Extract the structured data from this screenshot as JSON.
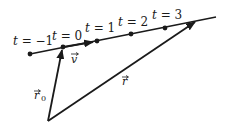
{
  "diagram": {
    "title": "",
    "line_labels": [
      {
        "id": "t-minus-1",
        "text": "t = −1",
        "x": 13,
        "y": 45
      },
      {
        "id": "t-0",
        "text": "t = 0",
        "x": 52,
        "y": 40
      },
      {
        "id": "t-1",
        "text": "t = 1",
        "x": 85,
        "y": 32
      },
      {
        "id": "t-2",
        "text": "t = 2",
        "x": 118,
        "y": 26
      },
      {
        "id": "t-3",
        "text": "t = 3",
        "x": 152,
        "y": 19
      }
    ],
    "points": [
      {
        "t": -1,
        "x": 30,
        "y": 54
      },
      {
        "t": 0,
        "x": 63,
        "y": 47
      },
      {
        "t": 1,
        "x": 97,
        "y": 41
      },
      {
        "t": 2,
        "x": 131,
        "y": 34
      },
      {
        "t": 3,
        "x": 165,
        "y": 28
      }
    ],
    "line": {
      "x1": 30,
      "y1": 54,
      "x2": 216,
      "y2": 17
    },
    "origin": {
      "x": 48,
      "y": 121
    },
    "vectors": {
      "v": {
        "label": "v⃗",
        "arrow_char": "→",
        "letter": "v"
      },
      "r0": {
        "letter": "r",
        "subscript": "0"
      },
      "r": {
        "letter": "r"
      }
    },
    "stroke_color": "#1a1a1a"
  }
}
